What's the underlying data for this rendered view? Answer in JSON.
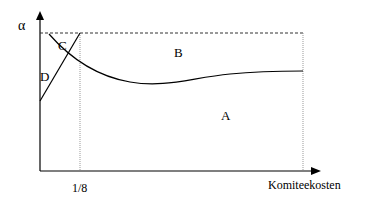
{
  "diagram": {
    "y_axis_label": "α",
    "x_axis_label": "Komiteekosten",
    "x_tick_label": "1/8",
    "regions": {
      "A": "A",
      "B": "B",
      "C": "C",
      "D": "D"
    },
    "colors": {
      "line": "#000000",
      "dashed": "#333333",
      "dotted": "#999999",
      "background": "#ffffff"
    }
  }
}
